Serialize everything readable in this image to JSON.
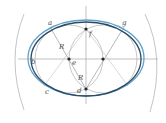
{
  "diagram": {
    "type": "geometric-construction",
    "colors": {
      "construction": "#9a9a9a",
      "axis": "#a8a8a8",
      "oval_dark": "#2c4a63",
      "oval_light": "#5fa3cc",
      "point": "#1e2a36",
      "label": "#4a4a4a"
    },
    "labels": {
      "a": "a",
      "b": "b",
      "c": "c",
      "d": "d",
      "e": "e",
      "f": "f",
      "g": "g",
      "R1": "R",
      "R2": "R"
    },
    "points": [
      {
        "name": "e",
        "x": 69,
        "y": 59
      },
      {
        "name": "e2",
        "x": 103,
        "y": 59
      },
      {
        "name": "f",
        "x": 86,
        "y": 29
      },
      {
        "name": "d",
        "x": 86,
        "y": 89
      }
    ]
  }
}
